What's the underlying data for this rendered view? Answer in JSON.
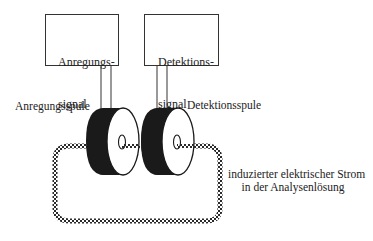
{
  "diagram": {
    "boxes": [
      {
        "id": "excitation",
        "line1": "Anregungs-",
        "line2": "signal"
      },
      {
        "id": "detection",
        "line1": "Detektions-",
        "line2": "signal"
      }
    ],
    "labels": {
      "excitation_coil": "Anregungsspule",
      "detection_coil": "Detektionsspule",
      "induced_current_line1": "induzierter elektrischer Strom",
      "induced_current_line2": "in der Analysenlösung"
    },
    "colors": {
      "line": "#333333",
      "coil_rim": "#1a1a1a",
      "coil_face": "#ffffff",
      "loop_dots": "#2a2a2a",
      "text": "#222222"
    }
  }
}
